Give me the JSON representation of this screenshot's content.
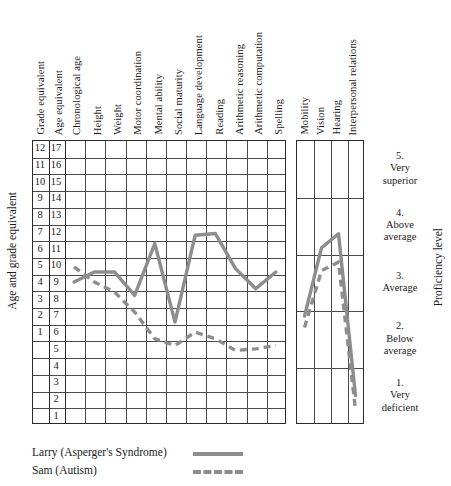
{
  "chart_data": {
    "type": "line",
    "title": "",
    "panels": [
      {
        "name": "academic-panel",
        "ylabel": "Age and grade equivalent",
        "categories": [
          "Grade equivalent",
          "Age equivalent",
          "Chronological age",
          "Height",
          "Weight",
          "Motor coordination",
          "Mental ability",
          "Social maturity",
          "Language development",
          "Reading",
          "Arithmetic reasoning",
          "Arithmetic computation",
          "Spelling"
        ],
        "plotted_categories": [
          "Chronological age",
          "Height",
          "Weight",
          "Motor coordination",
          "Mental ability",
          "Social maturity",
          "Language development",
          "Reading",
          "Arithmetic reasoning",
          "Arithmetic computation",
          "Spelling"
        ],
        "grade_scale": [
          12,
          11,
          10,
          9,
          8,
          7,
          6,
          5,
          4,
          3,
          2,
          1
        ],
        "age_scale": [
          17,
          16,
          15,
          14,
          13,
          12,
          11,
          10,
          9,
          8,
          7,
          6,
          5,
          4,
          3,
          2,
          1
        ],
        "ylim": [
          0.5,
          17.5
        ],
        "grid": true,
        "series": [
          {
            "name": "Larry (Asperger's Syndrome)",
            "style": "solid",
            "color": "#8d8d8d",
            "values": [
              9,
              9.6,
              9.6,
              8.2,
              11.3,
              6.6,
              11.8,
              11.9,
              9.8,
              8.6,
              9.6
            ]
          },
          {
            "name": "Sam (Autism)",
            "style": "dashed",
            "color": "#8d8d8d",
            "values": [
              9.9,
              9,
              8.4,
              7.2,
              5.6,
              5.2,
              6,
              5.6,
              4.9,
              5,
              5.2
            ]
          }
        ]
      },
      {
        "name": "proficiency-panel",
        "ylabel": "Proficiency level",
        "categories": [
          "Mobility",
          "Vision",
          "Hearing",
          "Interpersonal relations"
        ],
        "level_scale": [
          {
            "number": "5.",
            "label": "Very\nsuperior"
          },
          {
            "number": "4.",
            "label": "Above\naverage"
          },
          {
            "number": "3.",
            "label": "Average"
          },
          {
            "number": "2.",
            "label": "Below\naverage"
          },
          {
            "number": "1.",
            "label": "Very\ndeficient"
          }
        ],
        "ylim": [
          0.5,
          5.5
        ],
        "grid": true,
        "series": [
          {
            "name": "Larry (Asperger's Syndrome)",
            "style": "solid",
            "color": "#8d8d8d",
            "values": [
              2.4,
              3.6,
              3.85,
              1.0
            ]
          },
          {
            "name": "Sam (Autism)",
            "style": "dashed",
            "color": "#8d8d8d",
            "values": [
              2.2,
              3.2,
              3.35,
              0.75
            ]
          }
        ]
      }
    ],
    "legend": {
      "position": "bottom-left",
      "entries": [
        {
          "label": "Larry (Asperger's Syndrome)",
          "style": "solid",
          "color": "#8d8d8d"
        },
        {
          "label": "Sam (Autism)",
          "style": "dashed",
          "color": "#8d8d8d"
        }
      ]
    }
  }
}
